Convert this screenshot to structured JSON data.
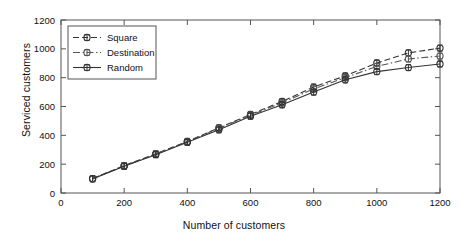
{
  "chart_data": {
    "type": "line",
    "title": "",
    "xlabel": "Number of customers",
    "ylabel": "Serviced customers",
    "xlim": [
      0,
      1200
    ],
    "ylim": [
      0,
      1200
    ],
    "xticks": [
      0,
      200,
      400,
      600,
      800,
      1000,
      1200
    ],
    "yticks": [
      0,
      200,
      400,
      600,
      800,
      1000,
      1200
    ],
    "grid": false,
    "legend_position": "upper-left",
    "x": [
      100,
      200,
      300,
      400,
      500,
      600,
      700,
      800,
      900,
      1000,
      1100,
      1200
    ],
    "series": [
      {
        "name": "Square",
        "color": "#333333",
        "linestyle": "dashed",
        "marker": "circle-plus",
        "values": [
          100,
          190,
          272,
          358,
          452,
          545,
          635,
          735,
          812,
          902,
          972,
          1005
        ],
        "errors": [
          8,
          9,
          9,
          10,
          10,
          11,
          11,
          12,
          12,
          12,
          13,
          13
        ]
      },
      {
        "name": "Destination",
        "color": "#555555",
        "linestyle": "dash-dot",
        "marker": "circle-plus",
        "values": [
          100,
          188,
          270,
          355,
          448,
          540,
          625,
          722,
          800,
          878,
          930,
          950
        ],
        "errors": [
          8,
          9,
          9,
          10,
          10,
          11,
          11,
          12,
          12,
          12,
          13,
          13
        ]
      },
      {
        "name": "Random",
        "color": "#333333",
        "linestyle": "solid",
        "marker": "circle-plus",
        "values": [
          98,
          185,
          266,
          352,
          438,
          533,
          612,
          700,
          785,
          842,
          870,
          895
        ],
        "errors": [
          8,
          9,
          9,
          10,
          10,
          11,
          11,
          12,
          12,
          12,
          13,
          13
        ]
      }
    ]
  },
  "legend": {
    "entries": [
      {
        "label": "Square"
      },
      {
        "label": "Destination"
      },
      {
        "label": "Random"
      }
    ]
  }
}
